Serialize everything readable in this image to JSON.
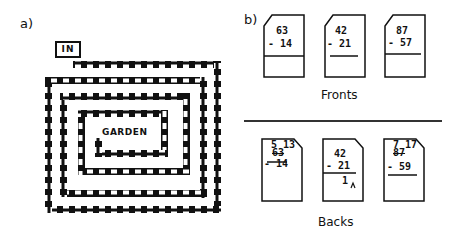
{
  "panel_a": {
    "label": "a)",
    "entrance_label": "IN",
    "goal_label": "GARDEN"
  },
  "panel_b": {
    "label": "b)",
    "fronts_caption": "Fronts",
    "backs_caption": "Backs",
    "fronts": [
      {
        "top": "63",
        "bottom": "- 14",
        "answer": ""
      },
      {
        "top": "42",
        "bottom": "- 21",
        "answer": ""
      },
      {
        "top": "87",
        "bottom": "- 57",
        "answer": ""
      }
    ],
    "backs": [
      {
        "borrow": "5 13",
        "top": "63",
        "bottom": "- 14",
        "answer": ""
      },
      {
        "borrow": "",
        "top": "42",
        "bottom": "- 21",
        "answer": "1"
      },
      {
        "borrow": "7 17",
        "top": "87",
        "bottom": "- 59",
        "answer": ""
      }
    ]
  },
  "colors": {
    "ink": "#111111",
    "paper": "#ffffff"
  }
}
